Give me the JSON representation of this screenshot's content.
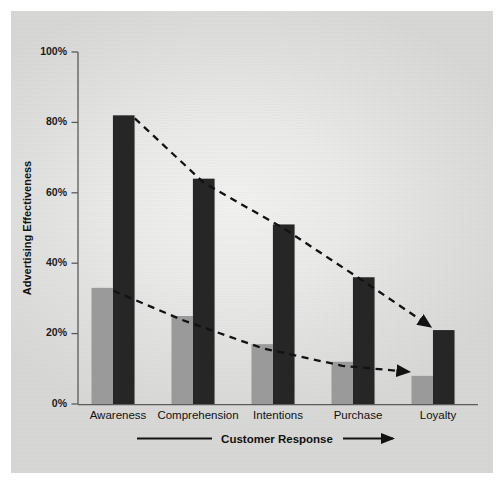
{
  "chart_data": {
    "type": "bar",
    "title": "",
    "xlabel": "Customer Response",
    "ylabel": "Advertising Effectiveness",
    "categories": [
      "Awareness",
      "Comprehension",
      "Intentions",
      "Purchase",
      "Loyalty"
    ],
    "series": [
      {
        "name": "gray",
        "color": "#9a9a9a",
        "values": [
          33,
          25,
          17,
          12,
          8
        ]
      },
      {
        "name": "dark",
        "color": "#262626",
        "values": [
          82,
          64,
          51,
          36,
          21
        ]
      }
    ],
    "ylim": [
      0,
      100
    ],
    "yticks": [
      0,
      20,
      40,
      60,
      80,
      100
    ],
    "ytick_labels": [
      "0%",
      "20%",
      "40%",
      "60%",
      "80%",
      "100%"
    ],
    "grid": false,
    "legend": "none",
    "annotations": [
      {
        "name": "trend-line-dark",
        "from": "Awareness",
        "to": "Loyalty",
        "style": "dashed-arrow",
        "values": [
          82,
          21
        ]
      },
      {
        "name": "trend-line-gray",
        "from": "Awareness",
        "to": "Loyalty",
        "style": "dashed-arrow",
        "values": [
          33,
          8
        ]
      }
    ]
  },
  "axes": {
    "y_title": "Advertising Effectiveness",
    "x_title": "Customer Response",
    "y_ticks": [
      "100%",
      "80%",
      "60%",
      "40%",
      "20%",
      "0%"
    ],
    "x_categories": [
      "Awareness",
      "Comprehension",
      "Intentions",
      "Purchase",
      "Loyalty"
    ]
  },
  "colors": {
    "bar_gray": "#9a9a9a",
    "bar_dark": "#262626",
    "axis": "#4a4a4a",
    "text": "#111111",
    "panel": "#e8e8e7",
    "page": "#ffffff"
  }
}
